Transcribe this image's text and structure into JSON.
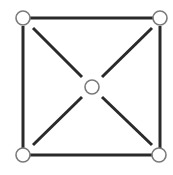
{
  "diagram": {
    "type": "graph",
    "colors": {
      "edge": "#2a2a2a",
      "node_fill": "#ffffff",
      "node_stroke": "#7a7a7a",
      "background": "#ffffff"
    },
    "node_radius": 7,
    "nodes": [
      {
        "id": "top-left",
        "x": 23,
        "y": 18
      },
      {
        "id": "top-right",
        "x": 160,
        "y": 18
      },
      {
        "id": "center",
        "x": 92,
        "y": 87
      },
      {
        "id": "bottom-left",
        "x": 23,
        "y": 155
      },
      {
        "id": "bottom-right",
        "x": 159,
        "y": 155
      }
    ],
    "edges": [
      {
        "from": "top-left",
        "to": "top-right",
        "x1": 30,
        "y1": 18,
        "x2": 153,
        "y2": 18
      },
      {
        "from": "top-left",
        "to": "bottom-left",
        "x1": 23,
        "y1": 26,
        "x2": 23,
        "y2": 148
      },
      {
        "from": "top-right",
        "to": "bottom-right",
        "x1": 160,
        "y1": 26,
        "x2": 160,
        "y2": 148
      },
      {
        "from": "bottom-left",
        "to": "bottom-right",
        "x1": 30,
        "y1": 155,
        "x2": 152,
        "y2": 155
      },
      {
        "from": "top-left",
        "to": "center",
        "x1": 33,
        "y1": 28,
        "x2": 82,
        "y2": 77
      },
      {
        "from": "top-right",
        "to": "center",
        "x1": 152,
        "y1": 28,
        "x2": 102,
        "y2": 77
      },
      {
        "from": "bottom-left",
        "to": "center",
        "x1": 33,
        "y1": 145,
        "x2": 82,
        "y2": 97
      },
      {
        "from": "bottom-right",
        "to": "center",
        "x1": 152,
        "y1": 145,
        "x2": 102,
        "y2": 97
      }
    ]
  }
}
